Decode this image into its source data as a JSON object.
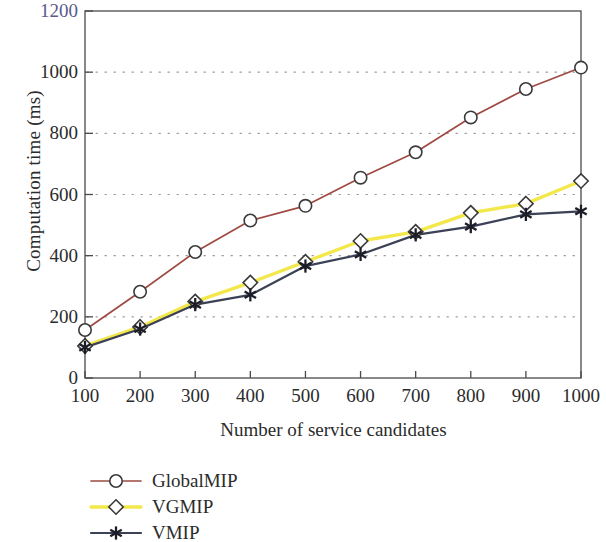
{
  "chart_data": {
    "type": "line",
    "title": "",
    "xlabel": "Number of service candidates",
    "ylabel": "Computation time (ms)",
    "x": [
      100,
      200,
      300,
      400,
      500,
      600,
      700,
      800,
      900,
      1000
    ],
    "xlim": [
      100,
      1000
    ],
    "ylim": [
      0,
      1200
    ],
    "xticks": [
      "100",
      "200",
      "300",
      "400",
      "500",
      "600",
      "700",
      "800",
      "900",
      "1000"
    ],
    "yticks": [
      "0",
      "200",
      "400",
      "600",
      "800",
      "1000",
      "1200"
    ],
    "grid": "dotted-horizontal",
    "legend_position": "below-axes-left",
    "series": [
      {
        "name": "GlobalMIP",
        "color": "#9e4a42",
        "marker": "circle-open",
        "marker_color": "#3a3a3a",
        "values": [
          157,
          282,
          412,
          515,
          563,
          655,
          738,
          852,
          945,
          1015
        ]
      },
      {
        "name": "VGMIP",
        "color": "#f2e84b",
        "marker": "diamond-open",
        "marker_color": "#3a3a3a",
        "values": [
          105,
          167,
          250,
          312,
          380,
          448,
          478,
          540,
          570,
          644
        ]
      },
      {
        "name": "VMIP",
        "color": "#3c4256",
        "marker": "asterisk",
        "marker_color": "#1d1d28",
        "values": [
          100,
          160,
          240,
          272,
          366,
          404,
          468,
          495,
          535,
          545
        ]
      }
    ]
  },
  "axes": {
    "y_tick_labels": [
      "1200",
      "1000",
      "800",
      "600",
      "400",
      "200",
      "0"
    ],
    "x_tick_labels": [
      "100",
      "200",
      "300",
      "400",
      "500",
      "600",
      "700",
      "800",
      "900",
      "1000"
    ],
    "y_axis_title": "Computation time (ms)",
    "x_axis_title": "Number of service candidates",
    "top_tick_label_color": "#5a5a8c",
    "tick_label_color": "#2b2b2b",
    "frame_color": "#4a4a4a",
    "grid_color": "#9a9a9a"
  },
  "legend": {
    "items": [
      {
        "label": "GlobalMIP",
        "line_color": "#9e4a42",
        "marker": "circle-open"
      },
      {
        "label": "VGMIP",
        "line_color": "#f2e84b",
        "marker": "diamond-open"
      },
      {
        "label": "VMIP",
        "line_color": "#3c4256",
        "marker": "asterisk"
      }
    ]
  }
}
